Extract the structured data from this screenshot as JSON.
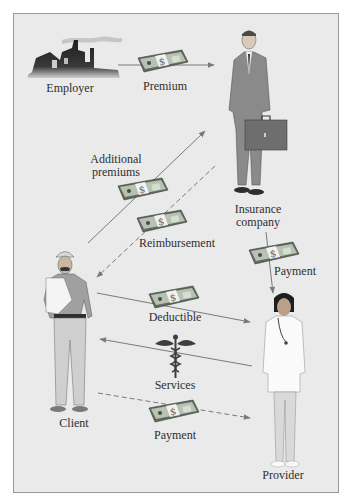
{
  "diagram": {
    "type": "health-insurance-flow",
    "nodes": [
      {
        "id": "employer",
        "label": "Employer",
        "icon": "factory-icon"
      },
      {
        "id": "insurer",
        "label": "Insurance\ncompany",
        "line1": "Insurance",
        "line2": "company",
        "icon": "businessman-with-briefcase-icon"
      },
      {
        "id": "client",
        "label": "Client",
        "icon": "injured-worker-icon"
      },
      {
        "id": "provider",
        "label": "Provider",
        "icon": "doctor-icon"
      }
    ],
    "edges": [
      {
        "id": "premium",
        "from": "employer",
        "to": "insurer",
        "label": "Premium",
        "style": "solid",
        "icon": "money-icon"
      },
      {
        "id": "additional-premiums",
        "from": "client",
        "to": "insurer",
        "label": "Additional premiums",
        "line1": "Additional",
        "line2": "premiums",
        "style": "solid",
        "icon": "money-icon"
      },
      {
        "id": "reimbursement",
        "from": "insurer",
        "to": "client",
        "label": "Reimbursement",
        "style": "dashed",
        "icon": "money-icon"
      },
      {
        "id": "insurer-payment",
        "from": "insurer",
        "to": "provider",
        "label": "Payment",
        "style": "solid",
        "icon": "money-icon"
      },
      {
        "id": "deductible",
        "from": "client",
        "to": "provider",
        "label": "Deductible",
        "style": "solid",
        "icon": "money-icon"
      },
      {
        "id": "services",
        "from": "provider",
        "to": "client",
        "label": "Services",
        "style": "solid",
        "icon": "caduceus-icon"
      },
      {
        "id": "client-payment",
        "from": "client",
        "to": "provider",
        "label": "Payment",
        "style": "dashed",
        "icon": "money-icon"
      }
    ]
  },
  "labels": {
    "employer": "Employer",
    "premium": "Premium",
    "additional_1": "Additional",
    "additional_2": "premiums",
    "insurance_1": "Insurance",
    "insurance_2": "company",
    "reimbursement": "Reimbursement",
    "insurer_payment": "Payment",
    "deductible": "Deductible",
    "services": "Services",
    "client": "Client",
    "client_payment": "Payment",
    "provider": "Provider"
  },
  "colors": {
    "background": "#eaeaea",
    "border": "#9a9a9a",
    "arrow": "#7a7a7a",
    "text": "#2e2e2e",
    "money": "#6f7a6a"
  }
}
